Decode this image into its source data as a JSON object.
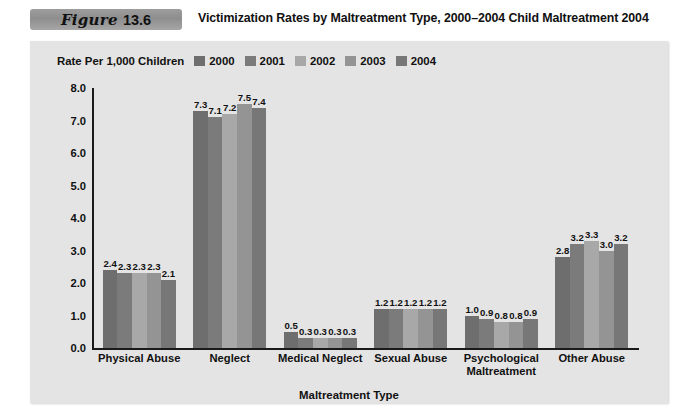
{
  "figure": {
    "badge_word": "Figure",
    "badge_number": "13.6",
    "title": "Victimization Rates by Maltreatment Type, 2000–2004 Child Maltreatment 2004"
  },
  "legend": {
    "title": "Rate Per 1,000 Children",
    "items": [
      {
        "label": "2000",
        "color": "#6e6e6e"
      },
      {
        "label": "2001",
        "color": "#7b7b7b"
      },
      {
        "label": "2002",
        "color": "#a8a8a8"
      },
      {
        "label": "2003",
        "color": "#949494"
      },
      {
        "label": "2004",
        "color": "#777777"
      }
    ]
  },
  "chart_data": {
    "type": "bar",
    "title": "Victimization Rates by Maltreatment Type, 2000–2004 Child Maltreatment 2004",
    "xlabel": "Maltreatment Type",
    "ylabel": "Rate Per 1,000 Children",
    "ylim": [
      0.0,
      8.0
    ],
    "ytick_labels": [
      "8.0",
      "7.0",
      "6.0",
      "5.0",
      "4.0",
      "3.0",
      "2.0",
      "1.0",
      "0.0"
    ],
    "ytick_values": [
      8.0,
      7.0,
      6.0,
      5.0,
      4.0,
      3.0,
      2.0,
      1.0,
      0.0
    ],
    "grid": false,
    "legend_position": "top-left",
    "categories": [
      "Physical Abuse",
      "Neglect",
      "Medical Neglect",
      "Sexual Abuse",
      "Psychological\nMaltreatment",
      "Other Abuse"
    ],
    "series": [
      {
        "name": "2000",
        "color": "#6e6e6e",
        "values": [
          2.4,
          7.3,
          0.5,
          1.2,
          1.0,
          2.8
        ],
        "labels": [
          "2.4",
          "7.3",
          "0.5",
          "1.2",
          "1.0",
          "2.8"
        ]
      },
      {
        "name": "2001",
        "color": "#7b7b7b",
        "values": [
          2.3,
          7.1,
          0.3,
          1.2,
          0.9,
          3.2
        ],
        "labels": [
          "2.3",
          "7.1",
          "0.3",
          "1.2",
          "0.9",
          "3.2"
        ]
      },
      {
        "name": "2002",
        "color": "#a8a8a8",
        "values": [
          2.3,
          7.2,
          0.3,
          1.2,
          0.8,
          3.3
        ],
        "labels": [
          "2.3",
          "7.2",
          "0.3",
          "1.2",
          "0.8",
          "3.3"
        ]
      },
      {
        "name": "2003",
        "color": "#949494",
        "values": [
          2.3,
          7.5,
          0.3,
          1.2,
          0.8,
          3.0
        ],
        "labels": [
          "2.3",
          "7.5",
          "0.3",
          "1.2",
          "0.8",
          "3.0"
        ]
      },
      {
        "name": "2004",
        "color": "#777777",
        "values": [
          2.1,
          7.4,
          0.3,
          1.2,
          0.9,
          3.2
        ],
        "labels": [
          "2.1",
          "7.4",
          "0.3",
          "1.2",
          "0.9",
          "3.2"
        ]
      }
    ]
  }
}
